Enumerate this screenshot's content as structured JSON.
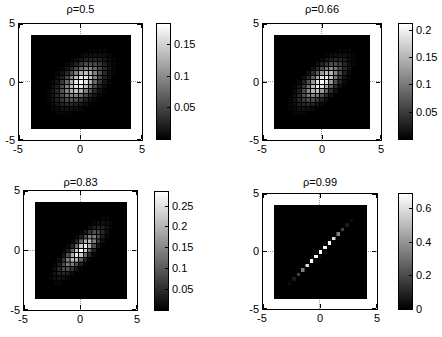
{
  "figure": {
    "width": 442,
    "height": 337,
    "background": "#ffffff"
  },
  "colors": {
    "background": "#ffffff",
    "image_background": "#000000",
    "colormap_low": "#000000",
    "colormap_high": "#ffffff",
    "zero_gridline": "#999999",
    "axis": "#000000",
    "text": "#000000"
  },
  "chart_data": [
    {
      "type": "heatmap",
      "title": "ρ=0.5",
      "rho": 0.5,
      "distribution": "standard bivariate normal density",
      "x_range": [
        -5,
        5
      ],
      "y_range": [
        -5,
        5
      ],
      "x_tick_labels": [
        "-5",
        "0",
        "5"
      ],
      "y_tick_labels": [
        "5",
        "0",
        "-5"
      ],
      "image_extent": {
        "x": [
          -4,
          4
        ],
        "y": [
          -4,
          4
        ]
      },
      "grid_cells": 21,
      "colormap": "gray",
      "color_scale": {
        "vmin": 0,
        "vmax": 0.184
      },
      "colorbar_tick_values": [
        0.15,
        0.1,
        0.05
      ],
      "colorbar_tick_labels": [
        "0.15",
        "0.1",
        "0.05"
      ],
      "zero_gridlines": true
    },
    {
      "type": "heatmap",
      "title": "ρ=0.66",
      "rho": 0.66,
      "distribution": "standard bivariate normal density",
      "x_range": [
        -5,
        5
      ],
      "y_range": [
        -5,
        5
      ],
      "x_tick_labels": [
        "-5",
        "0",
        "5"
      ],
      "y_tick_labels": [
        "5",
        "0",
        "-5"
      ],
      "image_extent": {
        "x": [
          -4,
          4
        ],
        "y": [
          -4,
          4
        ]
      },
      "grid_cells": 21,
      "colormap": "gray",
      "color_scale": {
        "vmin": 0,
        "vmax": 0.212
      },
      "colorbar_tick_values": [
        0.2,
        0.15,
        0.1,
        0.05
      ],
      "colorbar_tick_labels": [
        "0.2",
        "0.15",
        "0.1",
        "0.05"
      ],
      "zero_gridlines": true
    },
    {
      "type": "heatmap",
      "title": "ρ=0.83",
      "rho": 0.83,
      "distribution": "standard bivariate normal density",
      "x_range": [
        -5,
        5
      ],
      "y_range": [
        -5,
        5
      ],
      "x_tick_labels": [
        "-5",
        "0",
        "5"
      ],
      "y_tick_labels": [
        "5",
        "0",
        "-5"
      ],
      "image_extent": {
        "x": [
          -4,
          4
        ],
        "y": [
          -4,
          4
        ]
      },
      "grid_cells": 21,
      "colormap": "gray",
      "color_scale": {
        "vmin": 0,
        "vmax": 0.285
      },
      "colorbar_tick_values": [
        0.25,
        0.2,
        0.15,
        0.1,
        0.05
      ],
      "colorbar_tick_labels": [
        "0.25",
        "0.2",
        "0.15",
        "0.1",
        "0.05"
      ],
      "zero_gridlines": true
    },
    {
      "type": "heatmap",
      "title": "ρ=0.99",
      "rho": 0.99,
      "distribution": "standard bivariate normal density",
      "x_range": [
        -5,
        5
      ],
      "y_range": [
        -5,
        5
      ],
      "x_tick_labels": [
        "-5",
        "0",
        "5"
      ],
      "y_tick_labels": [
        "5",
        "0",
        "-5"
      ],
      "image_extent": {
        "x": [
          -4,
          4
        ],
        "y": [
          -4,
          4
        ]
      },
      "grid_cells": 21,
      "colormap": "gray",
      "color_scale": {
        "vmin": 0,
        "vmax": 0.69
      },
      "colorbar_tick_values": [
        0.6,
        0.4,
        0.2,
        0
      ],
      "colorbar_tick_labels": [
        "0.6",
        "0.4",
        "0.2",
        "0"
      ],
      "zero_gridlines": true
    }
  ]
}
